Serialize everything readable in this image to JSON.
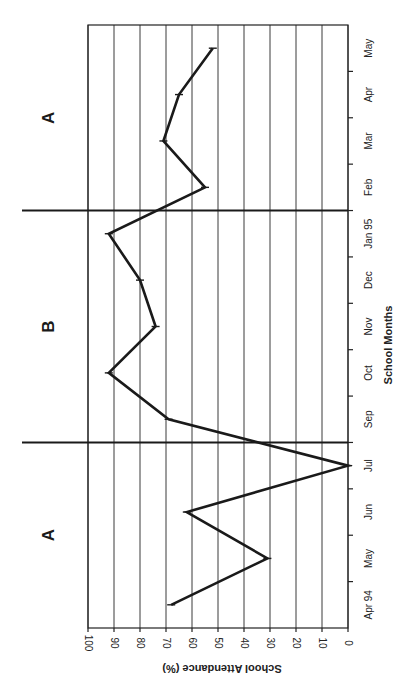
{
  "chart_data": {
    "type": "line",
    "title": "",
    "xlabel": "School Months",
    "ylabel": "School Attendance (%)",
    "ylim": [
      0,
      100
    ],
    "yticks": [
      0,
      10,
      20,
      30,
      40,
      50,
      60,
      70,
      80,
      90,
      100
    ],
    "grid": true,
    "orientation": "rotated 90 degrees (x-axis runs bottom-to-top along right edge)",
    "categories": [
      "Apr 94",
      "May",
      "Jun",
      "Jul",
      "Sep",
      "Oct",
      "Nov",
      "Dec",
      "Jan 95",
      "Feb",
      "Mar",
      "Apr",
      "May"
    ],
    "series": [
      {
        "name": "School Attendance",
        "values": [
          68,
          31,
          62,
          0,
          69,
          92,
          74,
          80,
          92,
          55,
          71,
          65,
          52
        ]
      }
    ],
    "phases": [
      {
        "label": "A",
        "from": "Apr 94",
        "to": "Jul"
      },
      {
        "label": "B",
        "from": "Sep",
        "to": "Jan 95"
      },
      {
        "label": "A",
        "from": "Feb",
        "to": "May"
      }
    ],
    "phase_change_lines_after": [
      "Jul",
      "Jan 95"
    ]
  },
  "labels": {
    "xlabel": "School Months",
    "ylabel": "School Attendance (%)",
    "yticks": [
      "0",
      "10",
      "20",
      "30",
      "40",
      "50",
      "60",
      "70",
      "80",
      "90",
      "100"
    ],
    "months": [
      "Apr 94",
      "May",
      "Jun",
      "Jul",
      "Sep",
      "Oct",
      "Nov",
      "Dec",
      "Jan 95",
      "Feb",
      "Mar",
      "Apr",
      "May"
    ],
    "phases": [
      "A",
      "B",
      "A"
    ]
  }
}
